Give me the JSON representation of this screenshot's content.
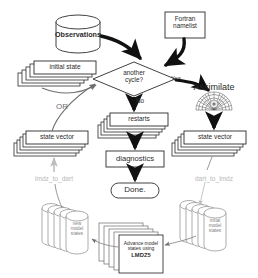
{
  "diagram": {
    "nodes": {
      "observations": {
        "label": "Observations",
        "shape": "cylinder"
      },
      "fortran_namelist": {
        "label": "Fortran\nnamelist",
        "line1": "Fortran",
        "line2": "namelist",
        "shape": "box"
      },
      "initial_state": {
        "label": "initial state",
        "shape": "stacked-box"
      },
      "decision": {
        "line1": "another",
        "line2": "cycle?",
        "shape": "diamond"
      },
      "assimilate": {
        "label": "Assimilate",
        "shape": "process-fan"
      },
      "restarts": {
        "label": "restarts",
        "shape": "stacked-box"
      },
      "diagnostics": {
        "label": "diagnostics",
        "shape": "box"
      },
      "done": {
        "label": "Done.",
        "shape": "rounded"
      },
      "state_vector_left": {
        "label": "state vector",
        "shape": "stacked-box"
      },
      "state_vector_right": {
        "label": "state vector",
        "shape": "stacked-box"
      },
      "new_model_states": {
        "line1": "new",
        "line2": "model",
        "line3": "states",
        "shape": "stacked-cylinder"
      },
      "initial_model_states": {
        "line1": "initial",
        "line2": "model",
        "line3": "states",
        "shape": "stacked-cylinder"
      },
      "advance_model": {
        "line1": "Advance model",
        "line2": "states using",
        "line3": "LMDZ5",
        "shape": "stacked-box"
      }
    },
    "edge_labels": {
      "yes": "Yes",
      "no": "No",
      "or": "OR",
      "lmdz_to_dart": "lmdz_to_dart",
      "dart_to_lmdz": "dart_to_lmdz"
    },
    "colors": {
      "stroke": "#2b2b2b",
      "thick_arrow": "#111111",
      "thin_arrow": "#6f6f6f",
      "faint_text": "#b9b9b9",
      "fill": "#ffffff"
    }
  }
}
